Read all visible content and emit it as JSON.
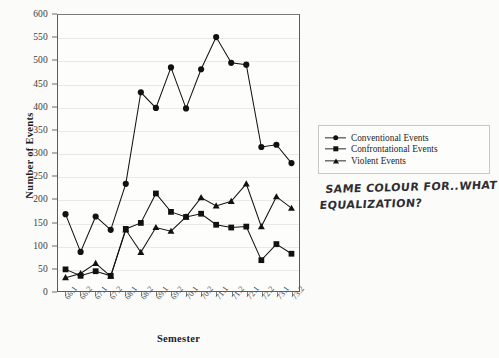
{
  "chart_data": {
    "type": "line",
    "title": "",
    "xlabel": "Semester",
    "ylabel": "Number of Events",
    "ylim": [
      0,
      600
    ],
    "ytick_step": 50,
    "yticks": [
      0,
      50,
      100,
      150,
      200,
      250,
      300,
      350,
      400,
      450,
      500,
      550,
      600
    ],
    "grid": true,
    "legend_position": "right",
    "categories": [
      "66.1",
      "66.2",
      "67.1",
      "67.2",
      "68.1",
      "68.2",
      "69.1",
      "69.2",
      "70.1",
      "70.2",
      "71.1",
      "71.2",
      "72.1",
      "72.2",
      "73.1",
      "73.2"
    ],
    "series": [
      {
        "name": "Conventional Events",
        "marker": "circle",
        "color": "#111111",
        "values": [
          167,
          85,
          162,
          133,
          233,
          432,
          398,
          486,
          397,
          482,
          552,
          496,
          492,
          313,
          318,
          278
        ]
      },
      {
        "name": "Confrontational Events",
        "marker": "square",
        "color": "#111111",
        "values": [
          47,
          33,
          43,
          33,
          135,
          148,
          212,
          172,
          161,
          168,
          144,
          138,
          140,
          67,
          102,
          81
        ]
      },
      {
        "name": "Violent Events",
        "marker": "triangle",
        "color": "#111111",
        "values": [
          29,
          38,
          60,
          32,
          133,
          84,
          138,
          130,
          161,
          203,
          185,
          195,
          233,
          140,
          205,
          180
        ]
      }
    ]
  },
  "legend": {
    "items": [
      {
        "label": "Conventional Events",
        "marker": "circle"
      },
      {
        "label": "Confrontational Events",
        "marker": "square"
      },
      {
        "label": "Violent Events",
        "marker": "triangle"
      }
    ]
  },
  "annotation": {
    "line1": "SAME COLOUR FOR..WHAT",
    "line2": "EQUALIZATION?"
  }
}
